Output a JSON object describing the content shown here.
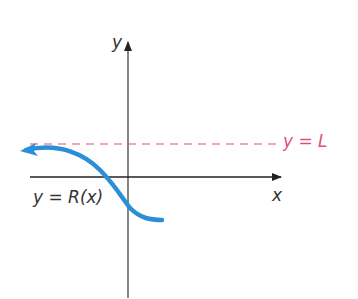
{
  "diagram": {
    "axes": {
      "x_label": "x",
      "y_label": "y"
    },
    "asymptote": {
      "label": "y = L",
      "color": "#e0507a",
      "style": "dashed"
    },
    "curve": {
      "label": "y = R(x)",
      "color": "#2a8fd6"
    },
    "colors": {
      "axis": "#222222",
      "text": "#333333"
    }
  }
}
